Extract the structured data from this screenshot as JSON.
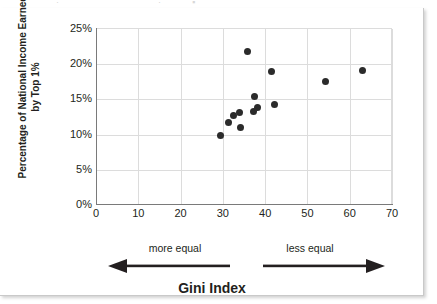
{
  "figure": {
    "top_sliver_fragments": [
      "·",
      "·",
      "▪"
    ]
  },
  "chart_data": {
    "type": "scatter",
    "title": "",
    "xlabel": "Gini Index",
    "ylabel": "Percentage of National Income Earned by Top 1%",
    "xlim": [
      0,
      70
    ],
    "ylim": [
      0,
      25
    ],
    "grid": true,
    "legend": "none",
    "x_ticks": [
      "0",
      "10",
      "20",
      "30",
      "40",
      "50",
      "60",
      "70"
    ],
    "x_tick_values": [
      0,
      10,
      20,
      30,
      40,
      50,
      60,
      70
    ],
    "y_ticks": [
      "0%",
      "5%",
      "10%",
      "15%",
      "20%",
      "25%"
    ],
    "y_tick_values": [
      0,
      5,
      10,
      15,
      20,
      25
    ],
    "marker_color": "#2b2b2b",
    "points": [
      {
        "x": 29.4,
        "y": 9.9
      },
      {
        "x": 31.3,
        "y": 11.7
      },
      {
        "x": 32.5,
        "y": 12.7
      },
      {
        "x": 34.0,
        "y": 13.2
      },
      {
        "x": 34.2,
        "y": 11.0
      },
      {
        "x": 35.8,
        "y": 21.8
      },
      {
        "x": 37.3,
        "y": 13.3
      },
      {
        "x": 37.5,
        "y": 15.4
      },
      {
        "x": 38.2,
        "y": 13.9
      },
      {
        "x": 41.5,
        "y": 18.9
      },
      {
        "x": 42.3,
        "y": 14.3
      },
      {
        "x": 54.2,
        "y": 17.5
      },
      {
        "x": 63.0,
        "y": 19.1
      }
    ],
    "annotations": [
      {
        "text": "more equal",
        "direction": "left"
      },
      {
        "text": "less equal",
        "direction": "right"
      }
    ]
  }
}
